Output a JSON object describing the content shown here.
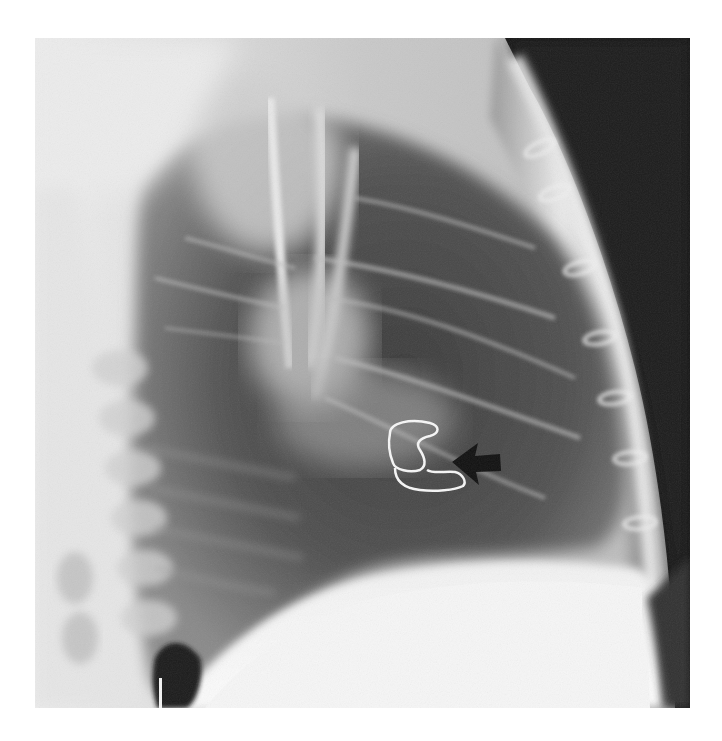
{
  "figure": {
    "type": "radiograph",
    "view": "lateral chest X-ray",
    "background_color": "#ffffff",
    "annotations": [
      {
        "kind": "arrow",
        "color": "#111111",
        "direction": "left",
        "target": "looped wire / device shadow in lower mid-lung"
      }
    ],
    "visible_features": [
      "sternal wire loops along anterior chest wall",
      "dark soft-tissue background at upper right",
      "bright diaphragm / abdomen at bottom",
      "spine on left side",
      "looped white wire marked by arrow"
    ],
    "caption": ""
  }
}
